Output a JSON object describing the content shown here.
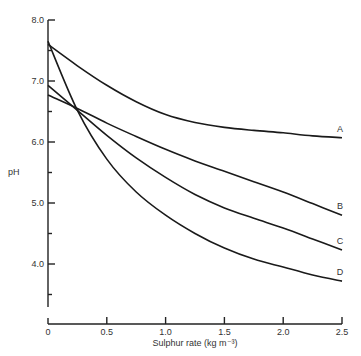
{
  "chart_data": {
    "type": "line",
    "title": "",
    "xlabel": "Sulphur rate (kg m⁻³)",
    "ylabel": "pH",
    "xlim": [
      0,
      2.5
    ],
    "ylim": [
      3.5,
      8.0
    ],
    "x_ticks": [
      "0",
      "0.5",
      "1.0",
      "1.5",
      "2.0",
      "2.5"
    ],
    "y_ticks": [
      "4.0",
      "5.0",
      "6.0",
      "7.0",
      "8.0"
    ],
    "grid": false,
    "legend": "inline labels at line ends",
    "x": [
      0,
      0.25,
      0.5,
      0.75,
      1.0,
      1.25,
      1.5,
      1.75,
      2.0,
      2.25,
      2.5
    ],
    "series": [
      {
        "name": "A",
        "values": [
          7.6,
          7.25,
          6.93,
          6.66,
          6.45,
          6.32,
          6.24,
          6.19,
          6.15,
          6.1,
          6.07
        ]
      },
      {
        "name": "B",
        "values": [
          6.77,
          6.55,
          6.31,
          6.09,
          5.88,
          5.69,
          5.52,
          5.35,
          5.18,
          4.99,
          4.8
        ]
      },
      {
        "name": "C",
        "values": [
          6.93,
          6.52,
          6.11,
          5.74,
          5.42,
          5.14,
          4.92,
          4.75,
          4.59,
          4.41,
          4.23
        ]
      },
      {
        "name": "D",
        "values": [
          7.65,
          6.52,
          5.72,
          5.18,
          4.8,
          4.5,
          4.26,
          4.08,
          3.95,
          3.82,
          3.72
        ]
      }
    ]
  }
}
